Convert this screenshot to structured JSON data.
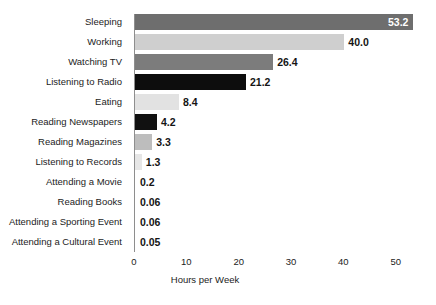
{
  "chart_data": {
    "type": "bar",
    "orientation": "horizontal",
    "title": "",
    "xlabel": "Hours per Week",
    "ylabel": "",
    "xlim": [
      0,
      53.5
    ],
    "xticks": [
      0,
      10,
      20,
      30,
      40,
      50
    ],
    "xtick_labels": [
      "0",
      "10",
      "20",
      "30",
      "40",
      "50"
    ],
    "grid": false,
    "legend": false,
    "categories": [
      "Sleeping",
      "Working",
      "Watching TV",
      "Listening to Radio",
      "Eating",
      "Reading Newspapers",
      "Reading Magazines",
      "Listening to Records",
      "Attending a Movie",
      "Reading Books",
      "Attending a Sporting Event",
      "Attending a Cultural Event"
    ],
    "values": [
      53.2,
      40.0,
      26.4,
      21.2,
      8.4,
      4.2,
      3.3,
      1.3,
      0.2,
      0.06,
      0.06,
      0.05
    ],
    "value_labels": [
      "53.2",
      "40.0",
      "26.4",
      "21.2",
      "8.4",
      "4.2",
      "3.3",
      "1.3",
      "0.2",
      "0.06",
      "0.06",
      "0.05"
    ],
    "bar_colors": [
      "#6e6e6e",
      "#cfcfcf",
      "#7c7c7c",
      "#0d0d0d",
      "#e2e2e2",
      "#111111",
      "#bdbdbd",
      "#e6e6e6",
      "#e6e6e6",
      "#e6e6e6",
      "#e6e6e6",
      "#e6e6e6"
    ],
    "label_inside": [
      true,
      false,
      false,
      false,
      false,
      false,
      false,
      false,
      false,
      false,
      false,
      false
    ],
    "axis_color": "#8e8e8e",
    "background": "#ffffff"
  }
}
